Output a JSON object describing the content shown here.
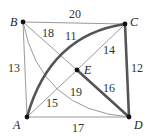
{
  "diagram": {
    "type": "weighted-graph",
    "vertices": [
      {
        "id": "A",
        "label": "A",
        "x": 27,
        "y": 117
      },
      {
        "id": "B",
        "label": "B",
        "x": 23,
        "y": 22
      },
      {
        "id": "C",
        "label": "C",
        "x": 125,
        "y": 24
      },
      {
        "id": "D",
        "label": "D",
        "x": 129,
        "y": 117
      },
      {
        "id": "E",
        "label": "E",
        "x": 77,
        "y": 70
      }
    ],
    "edges": [
      {
        "from": "B",
        "to": "C",
        "weight": "20",
        "style": "thin"
      },
      {
        "from": "A",
        "to": "B",
        "weight": "13",
        "style": "thin"
      },
      {
        "from": "A",
        "to": "D",
        "weight": "17",
        "style": "thin"
      },
      {
        "from": "C",
        "to": "D",
        "weight": "12",
        "style": "thick"
      },
      {
        "from": "B",
        "to": "E",
        "weight": "18",
        "style": "thin"
      },
      {
        "from": "A",
        "to": "C",
        "weight": "11",
        "style": "thick-curved"
      },
      {
        "from": "C",
        "to": "E",
        "weight": "14",
        "style": "thin"
      },
      {
        "from": "A",
        "to": "E",
        "weight": "15",
        "style": "thin"
      },
      {
        "from": "E",
        "to": "D",
        "weight": "16",
        "style": "thick"
      },
      {
        "from": "B",
        "to": "D",
        "weight": "19",
        "style": "thin-curved"
      }
    ],
    "colors": {
      "thin": "#9a9a9a",
      "thick": "#555555",
      "vertex": "#111111"
    }
  }
}
